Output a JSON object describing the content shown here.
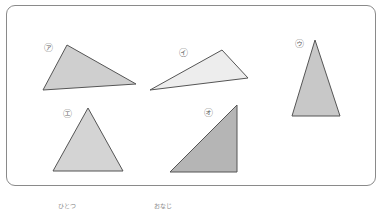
{
  "figure": {
    "triangles": [
      {
        "id": "a",
        "label": "㋐",
        "label_text": "あ",
        "points": "67,45 43,90 136,84",
        "fill": "#cfcfcf",
        "label_pos": [
          44,
          44
        ]
      },
      {
        "id": "i",
        "label": "㋑",
        "label_text": "い",
        "points": "222,50 150,90 248,78",
        "fill": "#ededed",
        "label_pos": [
          179,
          49
        ]
      },
      {
        "id": "u",
        "label": "㋒",
        "label_text": "う",
        "points": "315,40 292,116 340,116",
        "fill": "#c8c8c8",
        "label_pos": [
          295,
          40
        ]
      },
      {
        "id": "e",
        "label": "㋓",
        "label_text": "え",
        "points": "88,108 53,171 123,171",
        "fill": "#d4d4d4",
        "label_pos": [
          63,
          110
        ]
      },
      {
        "id": "o",
        "label": "㋔",
        "label_text": "お",
        "points": "237,105 170,172 237,172",
        "fill": "#b5b5b5",
        "label_pos": [
          204,
          109
        ]
      }
    ],
    "stroke": "#555555"
  },
  "footer": {
    "left_text": "ひとつ",
    "right_text": "おなじ"
  }
}
